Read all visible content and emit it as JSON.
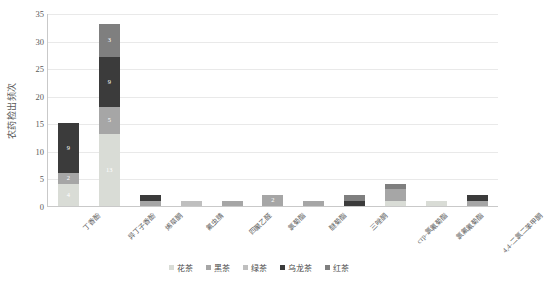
{
  "chart_data": {
    "type": "bar",
    "subtype": "stacked-bar",
    "title": "",
    "xlabel": "",
    "ylabel": "农药检出频次",
    "ylim": [
      0,
      35
    ],
    "yticks": [
      0,
      5,
      10,
      15,
      20,
      25,
      30,
      35
    ],
    "grid": true,
    "legend_position": "bottom",
    "categories": [
      "丁香酚",
      "异丁子香酚",
      "烯草酮",
      "氟虫腈",
      "四聚乙醛",
      "氯菊酯",
      "醚菊酯",
      "三唑酮",
      "стр-氯氰菊酯",
      "氯氟氰菊酯",
      "4,4-二氯二苯甲酮"
    ],
    "series": [
      {
        "name": "花茶",
        "color": "#d9dcd6",
        "values": [
          4,
          13,
          0,
          0,
          0,
          0,
          0,
          0,
          1,
          1,
          0
        ]
      },
      {
        "name": "黑茶",
        "color": "#a6a6a6",
        "values": [
          2,
          5,
          1,
          0,
          1,
          2,
          1,
          0,
          2,
          0,
          1
        ]
      },
      {
        "name": "绿茶",
        "color": "#bfbfbf",
        "values": [
          0,
          0,
          0,
          1,
          0,
          0,
          0,
          0,
          0,
          0,
          0
        ]
      },
      {
        "name": "乌龙茶",
        "color": "#3b3b3b",
        "values": [
          9,
          9,
          1,
          0,
          0,
          0,
          0,
          1,
          0,
          0,
          1
        ]
      },
      {
        "name": "红茶",
        "color": "#7f7f7f",
        "values": [
          0,
          6,
          0,
          0,
          0,
          0,
          0,
          1,
          1,
          0,
          0
        ]
      }
    ],
    "totals": [
      15,
      33,
      2,
      1,
      1,
      2,
      1,
      2,
      4,
      1,
      2
    ],
    "point_labels": {
      "丁香酚": [
        "4",
        "2",
        "",
        "9",
        ""
      ],
      "异丁子香酚": [
        "13",
        "5",
        "",
        "9",
        "3"
      ],
      "氯菊酯": [
        "",
        "2",
        "",
        "",
        ""
      ]
    }
  }
}
